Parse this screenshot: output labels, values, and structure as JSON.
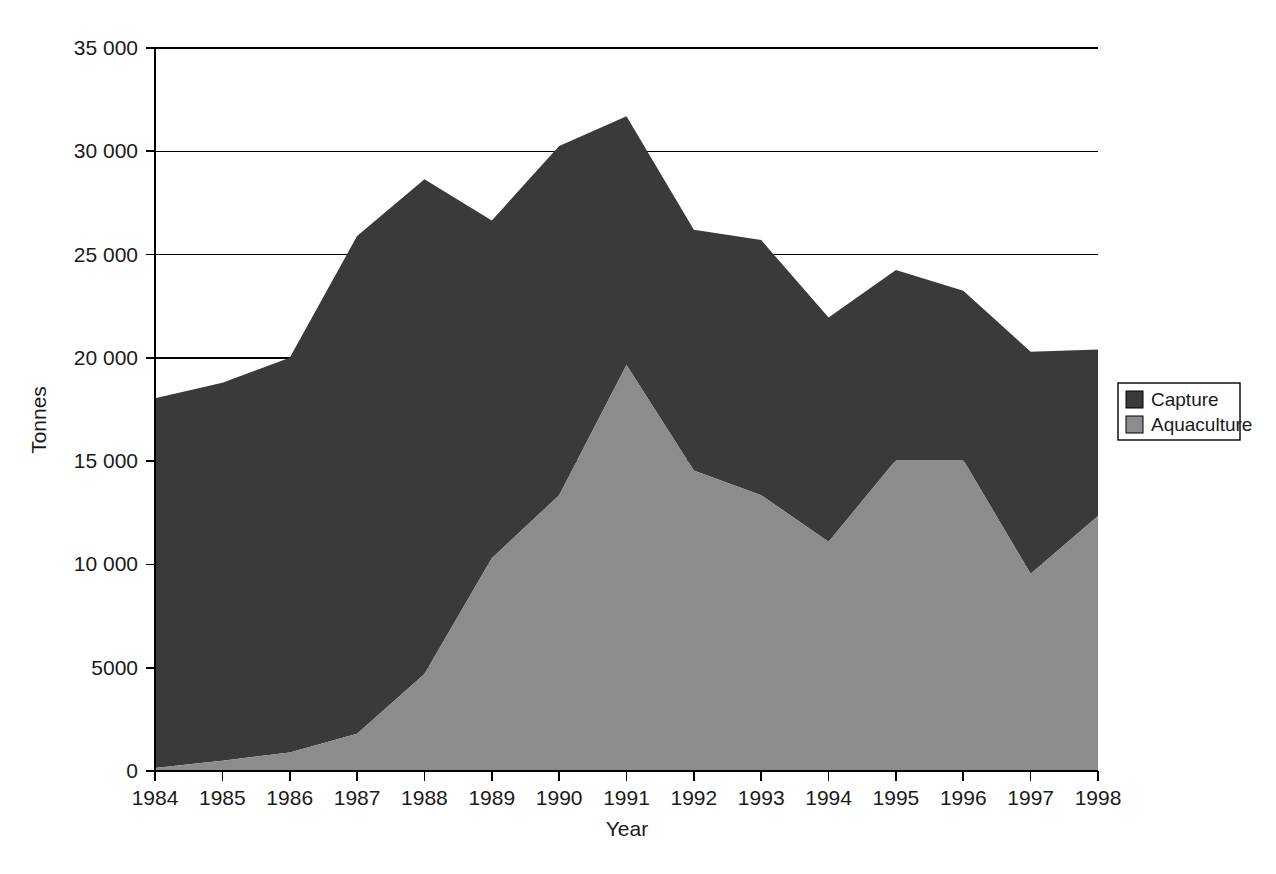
{
  "chart_data": {
    "type": "area",
    "stacked": true,
    "title": "",
    "xlabel": "Year",
    "ylabel": "Tonnes",
    "categories": [
      "1984",
      "1985",
      "1986",
      "1987",
      "1988",
      "1989",
      "1990",
      "1991",
      "1992",
      "1993",
      "1994",
      "1995",
      "1996",
      "1997",
      "1998"
    ],
    "x": [
      1984,
      1985,
      1986,
      1987,
      1988,
      1989,
      1990,
      1991,
      1992,
      1993,
      1994,
      1995,
      1996,
      1997,
      1998
    ],
    "series": [
      {
        "name": "Aquaculture",
        "color": "#8c8c8c",
        "values": [
          150,
          500,
          900,
          1800,
          4700,
          10300,
          13350,
          19650,
          14550,
          13350,
          11100,
          15050,
          15050,
          9550,
          12350
        ]
      },
      {
        "name": "Capture",
        "color": "#3a3a3a",
        "values": [
          17900,
          18300,
          19100,
          24100,
          23950,
          16350,
          16900,
          12050,
          11650,
          12350,
          10850,
          9200,
          8200,
          10750,
          8050
        ]
      }
    ],
    "totals": [
      18050,
      18800,
      20000,
      25900,
      28650,
      26650,
      30250,
      31700,
      26200,
      25700,
      21950,
      24250,
      23250,
      20300,
      20400
    ],
    "ylim": [
      0,
      35000
    ],
    "yticks": [
      0,
      5000,
      10000,
      15000,
      20000,
      25000,
      30000,
      35000
    ],
    "ytick_labels": [
      "0",
      "5000",
      "10 000",
      "15 000",
      "20 000",
      "25 000",
      "30 000",
      "35 000"
    ],
    "xtick_labels": [
      "1984",
      "1985",
      "1986",
      "1987",
      "1988",
      "1989",
      "1990",
      "1991",
      "1992",
      "1993",
      "1994",
      "1995",
      "1996",
      "1997",
      "1998"
    ],
    "grid": "horizontal",
    "legend_position": "right",
    "legend": [
      {
        "label": "Capture",
        "color": "#3a3a3a"
      },
      {
        "label": "Aquaculture",
        "color": "#8c8c8c"
      }
    ]
  },
  "axes": {
    "y_title": "Tonnes",
    "x_title": "Year"
  },
  "legend": {
    "items": [
      {
        "label": "Capture",
        "swatch": "legend-swatch-capture"
      },
      {
        "label": "Aquaculture",
        "swatch": "legend-swatch-aquaculture"
      }
    ]
  },
  "colors": {
    "capture": "#3a3a3a",
    "aquaculture": "#8c8c8c",
    "axis": "#000000",
    "background": "#ffffff"
  }
}
